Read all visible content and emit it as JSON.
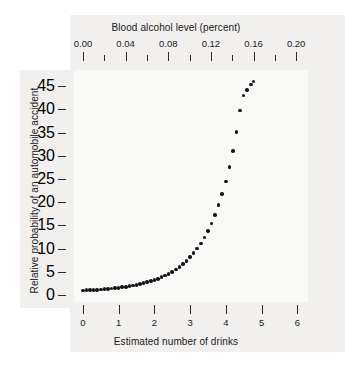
{
  "chart_data": {
    "type": "scatter",
    "title": "",
    "xlabel": "Estimated number of drinks",
    "ylabel": "Relative probability of an automobile accident",
    "secondary_xlabel": "Blood alcohol level (percent)",
    "xlim": [
      -0.25,
      6.3
    ],
    "ylim": [
      -1.5,
      48.5
    ],
    "secondary_xlim": [
      -0.0084,
      0.2111
    ],
    "grid": false,
    "legend": null,
    "xticks": [
      "0",
      "1",
      "2",
      "3",
      "4",
      "5",
      "6"
    ],
    "xtick_values": [
      0,
      1,
      2,
      3,
      4,
      5,
      6
    ],
    "yticks": [
      "0",
      "5",
      "10",
      "15",
      "20",
      "25",
      "30",
      "35",
      "40",
      "45"
    ],
    "ytick_values": [
      0,
      5,
      10,
      15,
      20,
      25,
      30,
      35,
      40,
      45
    ],
    "secondary_xticks": [
      "0.00",
      "0.04",
      "0.08",
      "0.12",
      "0.16",
      "0.20"
    ],
    "secondary_xtick_values": [
      0.0,
      0.04,
      0.08,
      0.12,
      0.16,
      0.2
    ],
    "secondary_xtick_minor_values": [
      0.02,
      0.06,
      0.1,
      0.14,
      0.18
    ],
    "bac_per_drink": 0.03354,
    "marker": "filled-circle",
    "marker_color": "#151515",
    "marker_size_px": 3.6,
    "x": [
      0.0,
      0.1,
      0.2,
      0.3,
      0.4,
      0.5,
      0.6,
      0.7,
      0.8,
      0.9,
      1.0,
      1.1,
      1.2,
      1.3,
      1.4,
      1.5,
      1.6,
      1.7,
      1.8,
      1.9,
      2.0,
      2.1,
      2.2,
      2.3,
      2.4,
      2.5,
      2.6,
      2.7,
      2.8,
      2.9,
      3.0,
      3.1,
      3.2,
      3.3,
      3.4,
      3.5,
      3.6,
      3.7,
      3.8,
      3.9,
      4.0,
      4.1,
      4.2,
      4.3,
      4.4,
      4.5,
      4.6,
      4.7,
      4.77
    ],
    "y": [
      1.0,
      1.03,
      1.06,
      1.1,
      1.15,
      1.2,
      1.26,
      1.33,
      1.4,
      1.48,
      1.57,
      1.67,
      1.78,
      1.9,
      2.04,
      2.19,
      2.36,
      2.54,
      2.75,
      2.98,
      3.23,
      3.52,
      3.83,
      4.19,
      4.58,
      5.02,
      5.51,
      6.06,
      6.68,
      7.37,
      8.15,
      9.03,
      10.02,
      11.14,
      12.4,
      13.83,
      15.45,
      17.29,
      19.38,
      21.76,
      24.47,
      27.56,
      31.09,
      35.13,
      39.76,
      43.0,
      44.2,
      45.4,
      46.0
    ]
  },
  "colors": {
    "panel_background": "#f1f0ef",
    "plot_background": "#f8f8f7",
    "page_background": "#ffffff",
    "marker": "#151515",
    "tick": "#2a2a2a",
    "text": "#1b1b1b"
  }
}
